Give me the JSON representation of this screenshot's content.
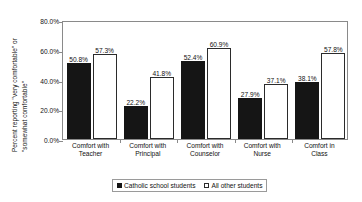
{
  "chart_data": {
    "type": "bar",
    "title": "",
    "xlabel": "",
    "ylabel_line1": "Percent reporting \"very comfortable\" or",
    "ylabel_line2": "\"somewhat comfortable\"",
    "ylim": [
      0,
      80
    ],
    "grid": false,
    "legend_position": "bottom-center",
    "ytick_labels": [
      "0.0%",
      "20.0%",
      "40.0%",
      "60.0%",
      "80.0%"
    ],
    "ytick_values": [
      0,
      20,
      40,
      60,
      80
    ],
    "categories": [
      "Comfort with Teacher",
      "Comfort with Principal",
      "Comfort with Counselor",
      "Comfort with Nurse",
      "Comfort in Class"
    ],
    "category_lines": [
      [
        "Comfort with",
        "Teacher"
      ],
      [
        "Comfort with",
        "Principal"
      ],
      [
        "Comfort with",
        "Counselor"
      ],
      [
        "Comfort with",
        "Nurse"
      ],
      [
        "Comfort in",
        "Class"
      ]
    ],
    "series": [
      {
        "name": "Catholic school students",
        "color": "#151515",
        "style": "filled",
        "values": [
          50.8,
          22.2,
          52.4,
          27.9,
          38.1
        ],
        "labels": [
          "50.8%",
          "22.2%",
          "52.4%",
          "27.9%",
          "38.1%"
        ]
      },
      {
        "name": "All other students",
        "color": "#ffffff",
        "style": "open",
        "values": [
          57.3,
          41.8,
          60.9,
          37.1,
          57.8
        ],
        "labels": [
          "57.3%",
          "41.8%",
          "60.9%",
          "37.1%",
          "57.8%"
        ]
      }
    ]
  },
  "legend": {
    "items": [
      {
        "label": "Catholic school students",
        "swatch": "dark"
      },
      {
        "label": "All other students",
        "swatch": "light"
      }
    ]
  }
}
